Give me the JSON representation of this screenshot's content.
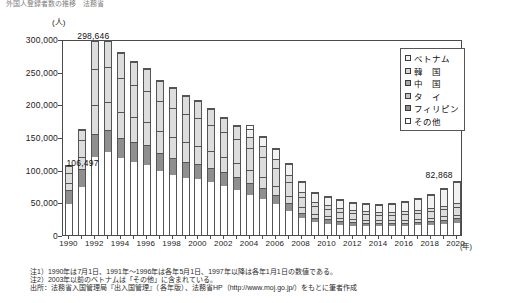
{
  "headline": "外国人登録者数の推移　法務省",
  "axis": {
    "unit_label": "(人)",
    "x_unit_label": "(年)",
    "y_ticks": [
      "300,000",
      "250,000",
      "200,000",
      "150,000",
      "100,000",
      "50,000",
      "0"
    ],
    "y_min": 0,
    "y_max": 300000,
    "y_step": 50000
  },
  "callouts": [
    {
      "text": "298,646",
      "year": 1992
    },
    {
      "text": "106,497",
      "year": 1990
    },
    {
      "text": "82,868",
      "year": 2020
    }
  ],
  "legend": {
    "items": [
      {
        "label": "ベトナム",
        "color": "#f2f2f2"
      },
      {
        "label": "韓　国",
        "color": "#d9d9d9"
      },
      {
        "label": "中　国",
        "color": "#a8a8a8"
      },
      {
        "label": "タ　イ",
        "color": "#c4c4c4"
      },
      {
        "label": "フィリピン",
        "color": "#8f8f8f"
      },
      {
        "label": "その他",
        "color": "#ffffff"
      }
    ]
  },
  "notes": [
    "注1）1990年は7月1日、1991年～1996年は各年5月1日、1997年以降は各年1月1日の数値である。",
    "注2）2003年以前のベトナムは「その他」に含まれている。"
  ],
  "source": "出所：法務省入国管理局『出入国管理』（各年版）、法務省HP（http://www.moj.go.jp/）をもとに筆者作成",
  "chart_data": {
    "type": "bar",
    "title": "",
    "xlabel": "(年)",
    "ylabel": "(人)",
    "ylim": [
      0,
      300000
    ],
    "grid": false,
    "legend_position": "top-right",
    "stacked": true,
    "categories": [
      "1990",
      "1991",
      "1992",
      "1993",
      "1994",
      "1995",
      "1996",
      "1997",
      "1998",
      "1999",
      "2000",
      "2001",
      "2002",
      "2003",
      "2004",
      "2005",
      "2006",
      "2007",
      "2008",
      "2009",
      "2010",
      "2011",
      "2012",
      "2013",
      "2014",
      "2015",
      "2016",
      "2017",
      "2018",
      "2019",
      "2020"
    ],
    "tick_labels": [
      "1990",
      "1992",
      "1994",
      "1996",
      "1998",
      "2000",
      "2002",
      "2004",
      "2006",
      "2008",
      "2010",
      "2012",
      "2014",
      "2016",
      "2018",
      "2020"
    ],
    "series": [
      {
        "name": "その他",
        "values": [
          48000,
          74000,
          120000,
          128000,
          118000,
          112000,
          108000,
          98000,
          92000,
          88000,
          86000,
          82000,
          76000,
          70000,
          62000,
          56000,
          48000,
          38000,
          26000,
          20000,
          18000,
          16000,
          15000,
          14500,
          14000,
          14000,
          14500,
          15000,
          16000,
          17500,
          19000
        ]
      },
      {
        "name": "フィリピン",
        "values": [
          22000,
          28000,
          36000,
          34000,
          32000,
          31000,
          30000,
          28000,
          27000,
          25000,
          24000,
          22000,
          21000,
          20000,
          18000,
          16000,
          14000,
          12000,
          9000,
          7000,
          6500,
          6000,
          5500,
          5200,
          5000,
          5000,
          5200,
          5500,
          6000,
          6500,
          7000
        ]
      },
      {
        "name": "タイ",
        "values": [
          11000,
          19000,
          44000,
          42000,
          40000,
          38000,
          36000,
          34000,
          32000,
          30000,
          28000,
          26000,
          24000,
          22000,
          20000,
          17000,
          14000,
          11000,
          8000,
          6000,
          5500,
          5000,
          4800,
          4500,
          4400,
          4400,
          4500,
          4700,
          5000,
          5200,
          5500
        ]
      },
      {
        "name": "中国",
        "values": [
          16000,
          26000,
          56000,
          54000,
          52000,
          50000,
          48000,
          46000,
          45000,
          44000,
          42000,
          40000,
          38000,
          36000,
          34000,
          32000,
          28000,
          22000,
          16000,
          12000,
          11000,
          10000,
          9500,
          9000,
          8800,
          8800,
          9000,
          9500,
          10000,
          11000,
          12000
        ]
      },
      {
        "name": "韓国",
        "values": [
          9497,
          15000,
          42646,
          40000,
          38000,
          36000,
          34000,
          32000,
          30000,
          28000,
          26000,
          24000,
          22000,
          20000,
          18000,
          16000,
          13000,
          10000,
          8000,
          6500,
          6000,
          5500,
          5200,
          5000,
          4800,
          4800,
          5000,
          5200,
          5500,
          6000,
          6500
        ]
      },
      {
        "name": "ベトナム",
        "values": [
          0,
          0,
          0,
          0,
          0,
          0,
          0,
          0,
          0,
          0,
          0,
          0,
          0,
          0,
          12000,
          14000,
          16000,
          17000,
          16000,
          14000,
          13000,
          12000,
          11000,
          11000,
          11000,
          12000,
          14000,
          17000,
          21000,
          26000,
          32868
        ]
      }
    ],
    "totals": [
      106497,
      162000,
      298646,
      298000,
      280000,
      267000,
      256000,
      238000,
      226000,
      215000,
      206000,
      194000,
      181000,
      168000,
      168000,
      151000,
      133000,
      110000,
      83000,
      65500,
      60000,
      54500,
      51000,
      49200,
      48000,
      49000,
      52200,
      56900,
      63500,
      72200,
      82868
    ]
  }
}
